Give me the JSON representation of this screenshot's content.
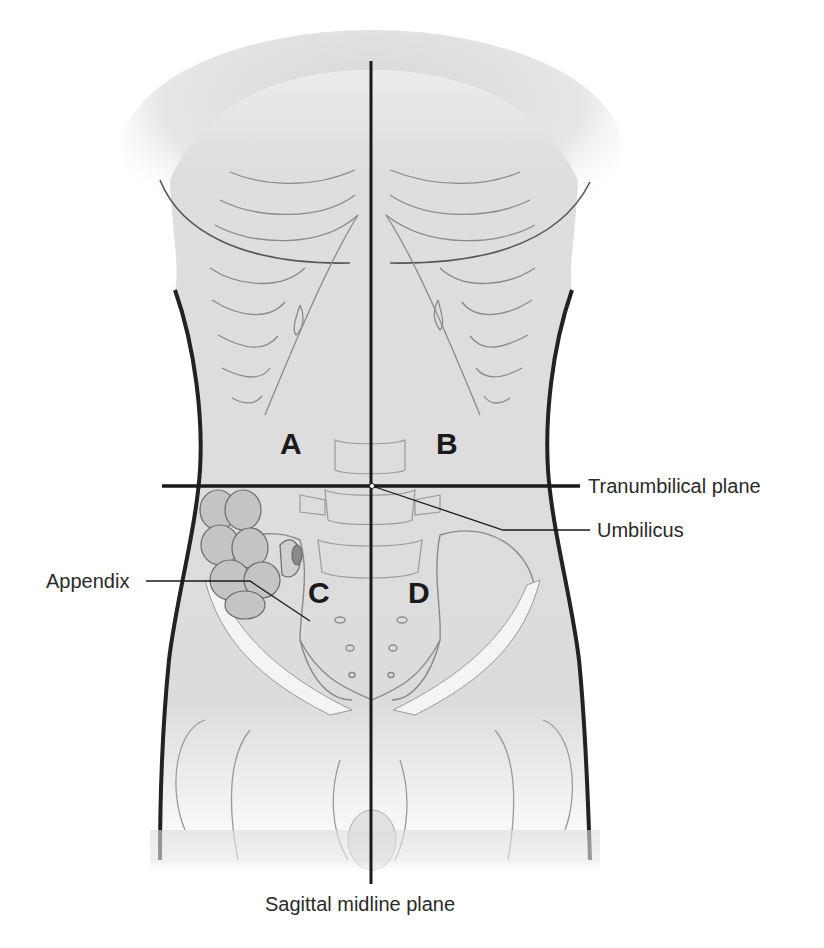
{
  "figure": {
    "quadrants": [
      {
        "letter": "A",
        "position": "upper-left"
      },
      {
        "letter": "B",
        "position": "upper-right"
      },
      {
        "letter": "C",
        "position": "lower-left"
      },
      {
        "letter": "D",
        "position": "lower-right"
      }
    ],
    "labels": {
      "transumbilical_plane": "Tranumbilical plane",
      "umbilicus": "Umbilicus",
      "appendix": "Appendix",
      "sagittal_plane": "Sagittal midline plane"
    },
    "colors": {
      "line": "#1a1a1a",
      "skin": "#dcdcdc",
      "outline": "#222222",
      "bone_line": "#8a8a8a",
      "background": "#ffffff"
    }
  }
}
